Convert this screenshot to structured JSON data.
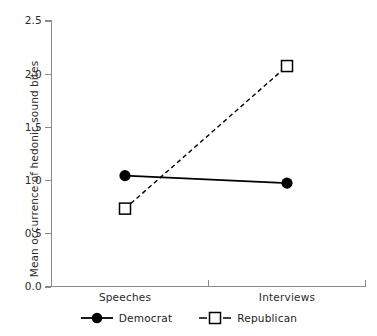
{
  "chart_data": {
    "type": "line",
    "title": "",
    "xlabel": "",
    "ylabel": "Mean occurrence of hedonic sound bites",
    "categories": [
      "Speeches",
      "Interviews"
    ],
    "series": [
      {
        "name": "Democrat",
        "values": [
          1.04,
          0.97
        ],
        "marker": "filled-circle",
        "linestyle": "solid",
        "color": "#000000"
      },
      {
        "name": "Republican",
        "values": [
          0.73,
          2.07
        ],
        "marker": "open-square",
        "linestyle": "dashed",
        "color": "#000000"
      }
    ],
    "ylim": [
      0.0,
      2.5
    ],
    "yticks": [
      "0.0",
      "0.5",
      "1.0",
      "1.5",
      "2.0",
      "2.5"
    ],
    "ytick_values": [
      0.0,
      0.5,
      1.0,
      1.5,
      2.0,
      2.5
    ],
    "xticks": [
      "Speeches",
      "Interviews"
    ],
    "grid": false,
    "legend_position": "bottom-center",
    "axis_color": "#8a8a8a",
    "background": "#ffffff"
  },
  "legend": {
    "items": [
      {
        "label": "Democrat",
        "marker": "filled-circle-icon",
        "linestyle": "solid"
      },
      {
        "label": "Republican",
        "marker": "open-square-icon",
        "linestyle": "dashed"
      }
    ]
  }
}
